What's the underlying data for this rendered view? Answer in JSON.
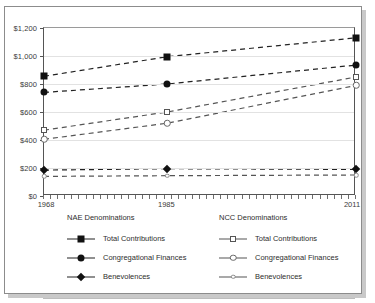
{
  "chart_data": {
    "type": "line",
    "title": "",
    "xlabel": "",
    "ylabel": "",
    "x": [
      1968,
      1985,
      2011
    ],
    "xtick_labels": [
      "1968",
      "1985",
      "2011"
    ],
    "ylim": [
      0,
      1200
    ],
    "ytick_values": [
      0,
      200,
      400,
      600,
      800,
      1000,
      1200
    ],
    "ytick_labels": [
      "$0",
      "$200",
      "$400",
      "$600",
      "$800",
      "$1,000",
      "$1,200"
    ],
    "grid": true,
    "legend_position": "below",
    "series": [
      {
        "name": "NAE Total Contributions",
        "group": "NAE Denominations",
        "label": "Total Contributions",
        "marker": "filled-square",
        "values": [
          855,
          995,
          1130
        ]
      },
      {
        "name": "NAE Congregational Finances",
        "group": "NAE Denominations",
        "label": "Congregational Finances",
        "marker": "filled-circle",
        "values": [
          740,
          800,
          935
        ]
      },
      {
        "name": "NAE Benevolences",
        "group": "NAE Denominations",
        "label": "Benevolences",
        "marker": "filled-diamond",
        "values": [
          185,
          195,
          190
        ]
      },
      {
        "name": "NCC Total Contributions",
        "group": "NCC Denominations",
        "label": "Total Contributions",
        "marker": "open-square",
        "values": [
          470,
          600,
          850
        ]
      },
      {
        "name": "NCC Congregational Finances",
        "group": "NCC Denominations",
        "label": "Congregational Finances",
        "marker": "open-circle",
        "values": [
          405,
          520,
          790
        ]
      },
      {
        "name": "NCC Benevolences",
        "group": "NCC Denominations",
        "label": "Benevolences",
        "marker": "open-small-circle",
        "values": [
          140,
          145,
          150
        ]
      }
    ]
  },
  "legend": {
    "groups": [
      {
        "title": "NAE Denominations",
        "items": [
          {
            "label": "Total Contributions",
            "marker": "filled-square"
          },
          {
            "label": "Congregational Finances",
            "marker": "filled-circle"
          },
          {
            "label": "Benevolences",
            "marker": "filled-diamond"
          }
        ]
      },
      {
        "title": "NCC Denominations",
        "items": [
          {
            "label": "Total Contributions",
            "marker": "open-square"
          },
          {
            "label": "Congregational Finances",
            "marker": "open-circle"
          },
          {
            "label": "Benevolences",
            "marker": "open-small-circle"
          }
        ]
      }
    ]
  },
  "colors": {
    "line": "#222222",
    "open_line": "#555555",
    "grid": "#e2e2e2",
    "axis": "#555555",
    "text": "#2d2d2d",
    "frame": "#8c8c8c",
    "background": "#ffffff"
  }
}
